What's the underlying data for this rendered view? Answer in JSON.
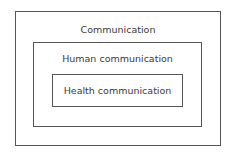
{
  "diagram": {
    "type": "nested-boxes",
    "levels": [
      {
        "label": "Communication"
      },
      {
        "label": "Human communication"
      },
      {
        "label": "Health communication"
      }
    ]
  }
}
